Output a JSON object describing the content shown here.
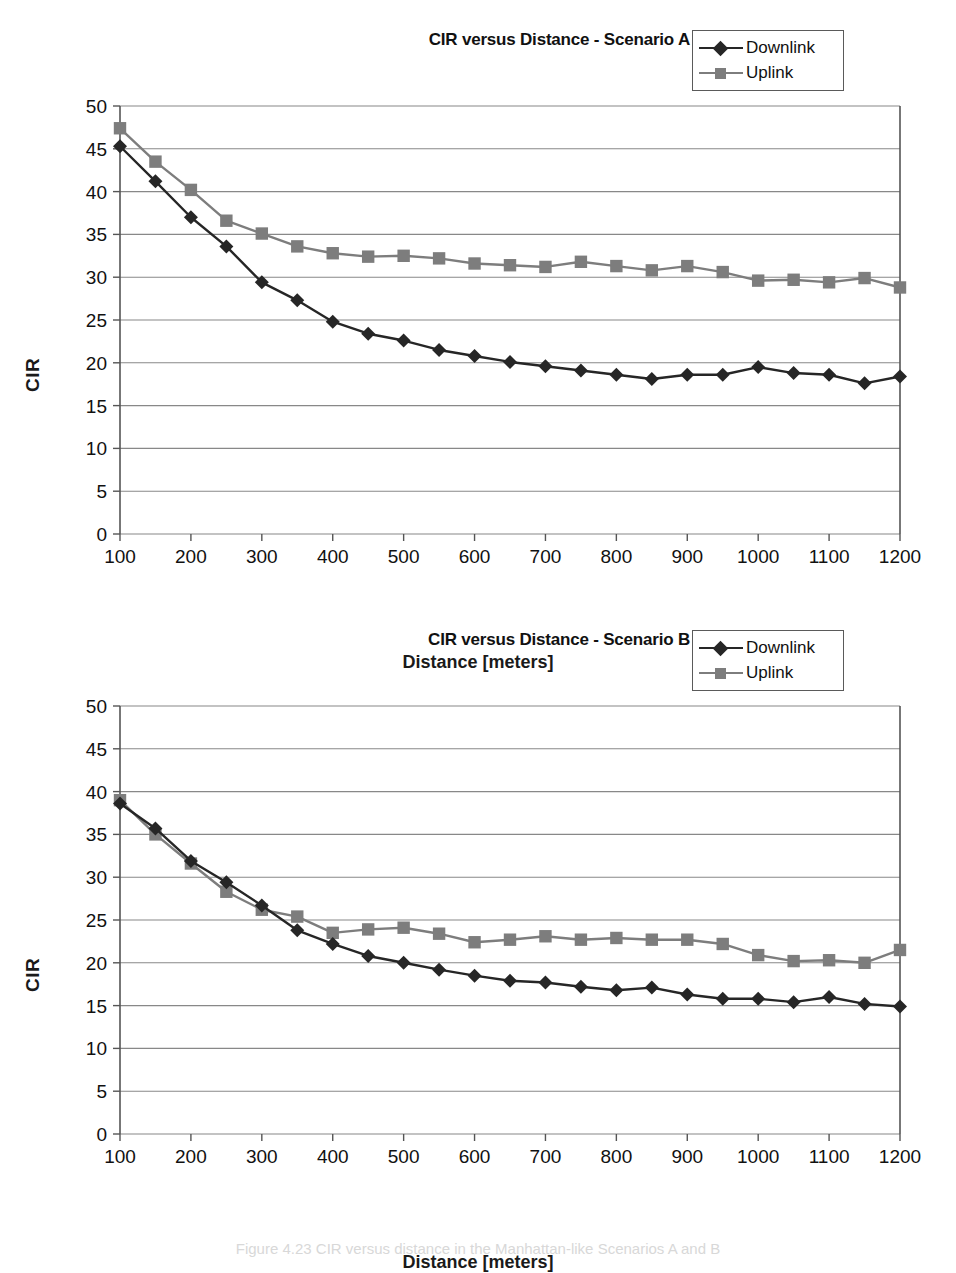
{
  "page": {
    "caption": "Figure 4.23   CIR versus distance in the Manhattan-like Scenarios A and B"
  },
  "colors": {
    "downlink": "#262626",
    "uplink": "#7d7d7d",
    "grid": "#888888",
    "axis": "#555555",
    "text": "#111111"
  },
  "common": {
    "xlabel": "Distance [meters]",
    "ylabel": "CIR",
    "legend": {
      "downlink_label": "Downlink",
      "uplink_label": "Uplink"
    }
  },
  "chart_data": [
    {
      "id": "scenario-a",
      "type": "line",
      "title": "CIR versus Distance - Scenario A",
      "xlabel": "Distance [meters]",
      "ylabel": "CIR",
      "xlim": [
        100,
        1200
      ],
      "ylim": [
        0,
        50
      ],
      "xticks": [
        100,
        200,
        300,
        400,
        500,
        600,
        700,
        800,
        900,
        1000,
        1100,
        1200
      ],
      "yticks": [
        0,
        5,
        10,
        15,
        20,
        25,
        30,
        35,
        40,
        45,
        50
      ],
      "grid": "horizontal",
      "legend_position": "top-right",
      "x": [
        100,
        150,
        200,
        250,
        300,
        350,
        400,
        450,
        500,
        550,
        600,
        650,
        700,
        750,
        800,
        850,
        900,
        950,
        1000,
        1050,
        1100,
        1150,
        1200
      ],
      "series": [
        {
          "name": "Downlink",
          "marker": "diamond",
          "color": "#262626",
          "values": [
            45.3,
            41.2,
            37.0,
            33.6,
            29.4,
            27.3,
            24.8,
            23.4,
            22.6,
            21.5,
            20.8,
            20.1,
            19.6,
            19.1,
            18.6,
            18.1,
            18.6,
            18.6,
            19.5,
            18.8,
            18.6,
            17.6,
            18.4
          ]
        },
        {
          "name": "Uplink",
          "marker": "square",
          "color": "#7d7d7d",
          "values": [
            47.4,
            43.5,
            40.2,
            36.6,
            35.1,
            33.6,
            32.8,
            32.4,
            32.5,
            32.2,
            31.6,
            31.4,
            31.2,
            31.8,
            31.3,
            30.8,
            31.3,
            30.6,
            29.6,
            29.7,
            29.4,
            29.9,
            28.8
          ]
        }
      ]
    },
    {
      "id": "scenario-b",
      "type": "line",
      "title": "CIR versus Distance - Scenario B",
      "xlabel": "Distance [meters]",
      "ylabel": "CIR",
      "xlim": [
        100,
        1200
      ],
      "ylim": [
        0,
        50
      ],
      "xticks": [
        100,
        200,
        300,
        400,
        500,
        600,
        700,
        800,
        900,
        1000,
        1100,
        1200
      ],
      "yticks": [
        0,
        5,
        10,
        15,
        20,
        25,
        30,
        35,
        40,
        45,
        50
      ],
      "grid": "horizontal",
      "legend_position": "top-right",
      "x": [
        100,
        150,
        200,
        250,
        300,
        350,
        400,
        450,
        500,
        550,
        600,
        650,
        700,
        750,
        800,
        850,
        900,
        950,
        1000,
        1050,
        1100,
        1150,
        1200
      ],
      "series": [
        {
          "name": "Downlink",
          "marker": "diamond",
          "color": "#262626",
          "values": [
            38.6,
            35.7,
            31.9,
            29.4,
            26.7,
            23.8,
            22.2,
            20.8,
            20.0,
            19.2,
            18.5,
            17.9,
            17.7,
            17.2,
            16.8,
            17.1,
            16.3,
            15.8,
            15.8,
            15.4,
            16.0,
            15.2,
            14.9
          ]
        },
        {
          "name": "Uplink",
          "marker": "square",
          "color": "#7d7d7d",
          "values": [
            39.0,
            35.0,
            31.6,
            28.3,
            26.2,
            25.4,
            23.5,
            23.9,
            24.1,
            23.4,
            22.4,
            22.7,
            23.1,
            22.7,
            22.9,
            22.7,
            22.7,
            22.2,
            20.9,
            20.2,
            20.3,
            20.0,
            21.5
          ]
        }
      ]
    }
  ]
}
